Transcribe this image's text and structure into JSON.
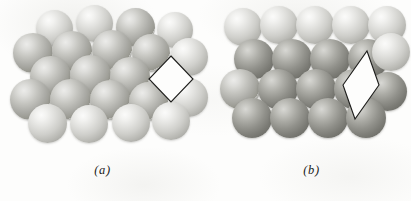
{
  "figure": {
    "background_color": "#fdfdfc",
    "outline_color": "#1d1d1b",
    "panels": [
      {
        "id": "a",
        "label": "(a)",
        "origin_x": 0,
        "packing": "close-packed spheres, staggered rows",
        "unit_cell_shape": "square rotated 45 degrees (diamond)",
        "unit_cell": {
          "left": 148,
          "top": 55,
          "width": 46,
          "height": 48,
          "points": "23,1 45,24 23,47 1,24"
        },
        "spheres": [
          {
            "x": 36,
            "y": 10,
            "d": 37,
            "tone": "light"
          },
          {
            "x": 76,
            "y": 5,
            "d": 37,
            "tone": "light"
          },
          {
            "x": 116,
            "y": 8,
            "d": 39,
            "tone": "mid"
          },
          {
            "x": 157,
            "y": 12,
            "d": 36,
            "tone": "light"
          },
          {
            "x": 13,
            "y": 33,
            "d": 40,
            "tone": "mid"
          },
          {
            "x": 52,
            "y": 31,
            "d": 40,
            "tone": "mid"
          },
          {
            "x": 92,
            "y": 30,
            "d": 40,
            "tone": "mid"
          },
          {
            "x": 132,
            "y": 34,
            "d": 38,
            "tone": "mid"
          },
          {
            "x": 170,
            "y": 38,
            "d": 38,
            "tone": "light"
          },
          {
            "x": 30,
            "y": 56,
            "d": 41,
            "tone": "mid"
          },
          {
            "x": 70,
            "y": 55,
            "d": 41,
            "tone": "mid"
          },
          {
            "x": 110,
            "y": 57,
            "d": 40,
            "tone": "mid"
          },
          {
            "x": 10,
            "y": 79,
            "d": 41,
            "tone": "mid"
          },
          {
            "x": 50,
            "y": 79,
            "d": 41,
            "tone": "mid"
          },
          {
            "x": 90,
            "y": 80,
            "d": 40,
            "tone": "mid"
          },
          {
            "x": 129,
            "y": 82,
            "d": 39,
            "tone": "mid"
          },
          {
            "x": 169,
            "y": 78,
            "d": 39,
            "tone": "light"
          },
          {
            "x": 28,
            "y": 104,
            "d": 39,
            "tone": "light"
          },
          {
            "x": 70,
            "y": 105,
            "d": 38,
            "tone": "light"
          },
          {
            "x": 112,
            "y": 104,
            "d": 38,
            "tone": "light"
          },
          {
            "x": 152,
            "y": 102,
            "d": 38,
            "tone": "light"
          }
        ]
      },
      {
        "id": "b",
        "label": "(b)",
        "origin_x": 212,
        "packing": "rows of spheres, alternating light and dark bands",
        "unit_cell_shape": "narrow rhombus (elongated vertically)",
        "unit_cell": {
          "left": 130,
          "top": 50,
          "width": 38,
          "height": 70,
          "points": "25,1 37,35 13,69 1,35"
        },
        "spheres": [
          {
            "x": 12,
            "y": 8,
            "d": 38,
            "tone": "light"
          },
          {
            "x": 48,
            "y": 6,
            "d": 38,
            "tone": "light"
          },
          {
            "x": 84,
            "y": 6,
            "d": 38,
            "tone": "light"
          },
          {
            "x": 120,
            "y": 6,
            "d": 38,
            "tone": "light"
          },
          {
            "x": 156,
            "y": 6,
            "d": 38,
            "tone": "light"
          },
          {
            "x": 22,
            "y": 39,
            "d": 40,
            "tone": "dark"
          },
          {
            "x": 60,
            "y": 39,
            "d": 40,
            "tone": "dark"
          },
          {
            "x": 98,
            "y": 39,
            "d": 40,
            "tone": "dark"
          },
          {
            "x": 136,
            "y": 39,
            "d": 40,
            "tone": "dark"
          },
          {
            "x": 160,
            "y": 33,
            "d": 38,
            "tone": "light"
          },
          {
            "x": 8,
            "y": 69,
            "d": 40,
            "tone": "mid"
          },
          {
            "x": 46,
            "y": 69,
            "d": 40,
            "tone": "dark"
          },
          {
            "x": 84,
            "y": 69,
            "d": 40,
            "tone": "dark"
          },
          {
            "x": 122,
            "y": 69,
            "d": 40,
            "tone": "dark"
          },
          {
            "x": 156,
            "y": 72,
            "d": 39,
            "tone": "dark"
          },
          {
            "x": 20,
            "y": 98,
            "d": 40,
            "tone": "dark"
          },
          {
            "x": 58,
            "y": 98,
            "d": 40,
            "tone": "dark"
          },
          {
            "x": 96,
            "y": 98,
            "d": 40,
            "tone": "dark"
          },
          {
            "x": 134,
            "y": 98,
            "d": 40,
            "tone": "dark"
          }
        ]
      }
    ]
  }
}
